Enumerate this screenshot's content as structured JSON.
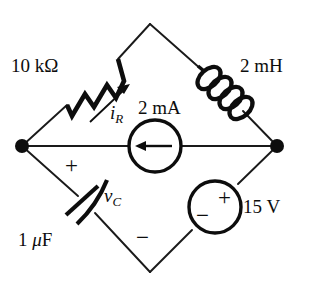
{
  "figure": {
    "type": "electrical-circuit-schematic",
    "topology": "diamond-bridge",
    "background_color": "#ffffff",
    "line_color": "#0d0d0d"
  },
  "nodes": {
    "left": {
      "x": 22,
      "y": 146,
      "dot": true
    },
    "right": {
      "x": 277,
      "y": 146,
      "dot": true
    },
    "top": {
      "x": 150,
      "y": 24,
      "dot": false
    },
    "bottom": {
      "x": 150,
      "y": 272,
      "dot": false
    }
  },
  "components": {
    "resistor": {
      "name": "resistor",
      "symbol": "zigzag",
      "value": "10 kΩ",
      "branch": "left-node-to-top-vertex",
      "current_label": "i",
      "current_subscript": "R",
      "current_arrow": "up-right"
    },
    "inductor": {
      "name": "inductor",
      "symbol": "coil",
      "value": "2 mH",
      "branch": "top-vertex-to-right-node",
      "loops": 4
    },
    "current_source": {
      "name": "current-source",
      "symbol": "circle-with-arrow",
      "value": "2 mA",
      "branch": "left-node-to-right-node",
      "arrow_direction": "left"
    },
    "capacitor": {
      "name": "capacitor",
      "symbol": "curved-plate-capacitor",
      "value": "1 μF",
      "branch": "left-node-to-bottom-vertex",
      "voltage_label": "v",
      "voltage_subscript": "C",
      "polarity_plus": "+",
      "polarity_minus": "−"
    },
    "voltage_source": {
      "name": "voltage-source",
      "symbol": "circle-with-plus-minus",
      "value": "15 V",
      "branch": "bottom-vertex-to-right-node",
      "polarity_plus": "+",
      "polarity_minus": "−"
    }
  }
}
